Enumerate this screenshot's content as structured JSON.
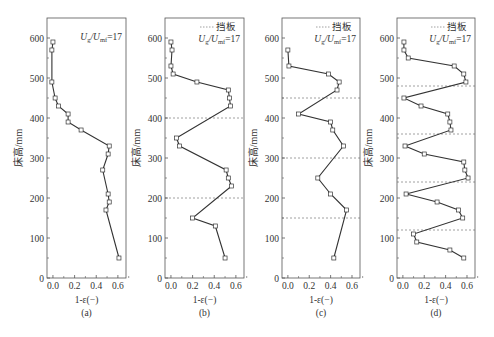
{
  "figure": {
    "ylabel": "床高/mm",
    "xlabel": "1-ε(−)",
    "annotation": "Ug/Umf=17",
    "annotation_parts": {
      "U1": "U",
      "sub1": "g",
      "slash": "/",
      "U2": "U",
      "sub2": "mf",
      "eq": "=17"
    },
    "legend_label": "挡板",
    "colors": {
      "line": "#333333",
      "axis": "#555555",
      "baffle": "#888888",
      "marker_fill": "#ffffff"
    }
  },
  "chart_data": [
    {
      "type": "line",
      "panel_label": "(a)",
      "title": "",
      "xlabel": "1-ε(−)",
      "ylabel": "床高/mm",
      "xlim": [
        -0.055,
        0.675
      ],
      "ylim": [
        0,
        650
      ],
      "xticks": [
        0.0,
        0.2,
        0.4,
        0.6
      ],
      "xtick_labels": [
        "0.0",
        "0.2",
        "0.4",
        "0.6"
      ],
      "yticks": [
        0,
        100,
        200,
        300,
        400,
        500,
        600
      ],
      "ytick_labels": [
        "0",
        "100",
        "200",
        "300",
        "400",
        "500",
        "600"
      ],
      "annotation": "Ug/Umf=17",
      "legend": null,
      "baffles": [],
      "series": [
        {
          "name": "1-ε",
          "x": [
            0.0,
            -0.01,
            -0.01,
            0.02,
            0.05,
            0.14,
            0.14,
            0.26,
            0.52,
            0.51,
            0.46,
            0.51,
            0.52,
            0.49,
            0.61
          ],
          "y": [
            590,
            570,
            490,
            450,
            430,
            410,
            390,
            370,
            330,
            310,
            270,
            210,
            190,
            170,
            50
          ]
        }
      ]
    },
    {
      "type": "line",
      "panel_label": "(b)",
      "title": "",
      "xlabel": "1-ε(−)",
      "ylabel": "",
      "xlim": [
        -0.055,
        0.675
      ],
      "ylim": [
        0,
        650
      ],
      "xticks": [
        0.0,
        0.2,
        0.4,
        0.6
      ],
      "xtick_labels": [
        "0.0",
        "0.2",
        "0.4",
        "0.6"
      ],
      "yticks": [
        0,
        100,
        200,
        300,
        400,
        500,
        600
      ],
      "ytick_labels": [
        "0",
        "100",
        "200",
        "300",
        "400",
        "500",
        "600"
      ],
      "annotation": "Ug/Umf=17",
      "legend": "挡板",
      "baffles": [
        400,
        200
      ],
      "series": [
        {
          "name": "1-ε",
          "x": [
            0.0,
            0.01,
            0.0,
            0.02,
            0.24,
            0.53,
            0.54,
            0.55,
            0.05,
            0.08,
            0.51,
            0.53,
            0.56,
            0.2,
            0.41,
            0.5
          ],
          "y": [
            590,
            570,
            530,
            510,
            490,
            470,
            450,
            430,
            350,
            330,
            270,
            250,
            230,
            150,
            130,
            50
          ]
        }
      ]
    },
    {
      "type": "line",
      "panel_label": "(c)",
      "title": "",
      "xlabel": "1-ε(−)",
      "ylabel": "",
      "xlim": [
        -0.055,
        0.675
      ],
      "ylim": [
        0,
        650
      ],
      "xticks": [
        0.0,
        0.2,
        0.4,
        0.6
      ],
      "xtick_labels": [
        "0.0",
        "0.2",
        "0.4",
        "0.6"
      ],
      "yticks": [
        0,
        100,
        200,
        300,
        400,
        500,
        600
      ],
      "ytick_labels": [
        "0",
        "100",
        "200",
        "300",
        "400",
        "500",
        "600"
      ],
      "annotation": "Ug/Umf=17",
      "legend": "挡板",
      "baffles": [
        450,
        300,
        150
      ],
      "series": [
        {
          "name": "1-ε",
          "x": [
            0.0,
            0.01,
            0.38,
            0.48,
            0.46,
            0.1,
            0.4,
            0.42,
            0.52,
            0.28,
            0.4,
            0.55,
            0.43
          ],
          "y": [
            570,
            530,
            510,
            490,
            470,
            410,
            390,
            370,
            330,
            250,
            210,
            170,
            50
          ]
        }
      ]
    },
    {
      "type": "line",
      "panel_label": "(d)",
      "title": "",
      "xlabel": "1-ε(−)",
      "ylabel": "",
      "xlim": [
        -0.055,
        0.675
      ],
      "ylim": [
        0,
        650
      ],
      "xticks": [
        0.0,
        0.2,
        0.4,
        0.6
      ],
      "xtick_labels": [
        "0.0",
        "0.2",
        "0.4",
        "0.6"
      ],
      "yticks": [
        0,
        100,
        200,
        300,
        400,
        500,
        600
      ],
      "ytick_labels": [
        "0",
        "100",
        "200",
        "300",
        "400",
        "500",
        "600"
      ],
      "annotation": "Ug/Umf=17",
      "legend": "挡板",
      "baffles": [
        480,
        360,
        240,
        120
      ],
      "series": [
        {
          "name": "1-ε",
          "x": [
            0.01,
            0.01,
            0.05,
            0.48,
            0.57,
            0.59,
            0.01,
            0.17,
            0.42,
            0.44,
            0.45,
            0.02,
            0.2,
            0.57,
            0.58,
            0.61,
            0.03,
            0.32,
            0.52,
            0.56,
            0.1,
            0.13,
            0.44,
            0.57
          ],
          "y": [
            590,
            570,
            550,
            530,
            510,
            490,
            450,
            430,
            410,
            390,
            370,
            330,
            310,
            290,
            270,
            250,
            210,
            190,
            170,
            150,
            110,
            90,
            70,
            50
          ]
        }
      ]
    }
  ]
}
